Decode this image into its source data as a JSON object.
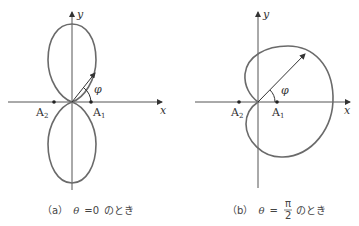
{
  "figures": [
    {
      "id": "a",
      "axis_x_label": "x",
      "axis_y_label": "y",
      "angle_label": "φ",
      "point_left": {
        "name": "A",
        "sub": "2"
      },
      "point_right": {
        "name": "A",
        "sub": "1"
      },
      "caption_prefix": "（a）",
      "caption_theta": "θ",
      "caption_eq": "=0",
      "caption_suffix": "のとき"
    },
    {
      "id": "b",
      "axis_x_label": "x",
      "axis_y_label": "y",
      "angle_label": "φ",
      "point_left": {
        "name": "A",
        "sub": "2"
      },
      "point_right": {
        "name": "A",
        "sub": "1"
      },
      "caption_prefix": "（b）",
      "caption_theta": "θ",
      "caption_eq": "=",
      "caption_frac_num": "π",
      "caption_frac_den": "2",
      "caption_suffix": "のとき"
    }
  ],
  "colors": {
    "curve": "#6a6a6a",
    "axis": "#555555",
    "text": "#333333"
  }
}
